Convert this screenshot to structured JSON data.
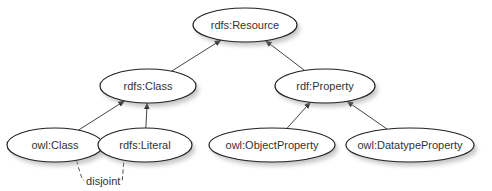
{
  "diagram": {
    "type": "class-hierarchy",
    "nodes": [
      {
        "id": "resource",
        "label": "rdfs:Resource",
        "cx": 245,
        "cy": 25,
        "rx": 52,
        "ry": 17
      },
      {
        "id": "class",
        "label": "rdfs:Class",
        "cx": 148,
        "cy": 86,
        "rx": 48,
        "ry": 17
      },
      {
        "id": "property",
        "label": "rdf:Property",
        "cx": 325,
        "cy": 86,
        "rx": 50,
        "ry": 17
      },
      {
        "id": "owlclass",
        "label": "owl:Class",
        "cx": 55,
        "cy": 145,
        "rx": 48,
        "ry": 17
      },
      {
        "id": "literal",
        "label": "rdfs:Literal",
        "cx": 145,
        "cy": 145,
        "rx": 47,
        "ry": 17
      },
      {
        "id": "objprop",
        "label": "owl:ObjectProperty",
        "cx": 272,
        "cy": 145,
        "rx": 63,
        "ry": 17
      },
      {
        "id": "dtprop",
        "label": "owl:DatatypeProperty",
        "cx": 410,
        "cy": 145,
        "rx": 64,
        "ry": 17
      }
    ],
    "edges": [
      {
        "from": "class",
        "to": "resource",
        "type": "subClassOf"
      },
      {
        "from": "property",
        "to": "resource",
        "type": "subClassOf"
      },
      {
        "from": "owlclass",
        "to": "class",
        "type": "subClassOf"
      },
      {
        "from": "literal",
        "to": "class",
        "type": "subClassOf"
      },
      {
        "from": "objprop",
        "to": "property",
        "type": "subClassOf"
      },
      {
        "from": "dtprop",
        "to": "property",
        "type": "subClassOf"
      }
    ],
    "annotations": [
      {
        "label": "disjoint",
        "between": [
          "owlclass",
          "literal"
        ],
        "style": "dashed"
      }
    ]
  }
}
